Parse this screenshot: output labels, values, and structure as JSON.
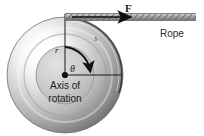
{
  "figure": {
    "background": "#ffffff",
    "width": 204,
    "height": 136
  },
  "labels": {
    "force": "F",
    "rope": "Rope",
    "axis_of_rotation_line1": "Axis of",
    "axis_of_rotation_line2": "rotation",
    "radius": "r",
    "angle": "θ",
    "arc_length": "s"
  },
  "colors": {
    "wheel_rim_dark": "#6f6f6f",
    "wheel_rim_mid": "#a8a8a8",
    "wheel_rim_light": "#f2f2f2",
    "hub_fill": "#c9c9c9",
    "hub_edge": "#9a9a9a",
    "line_stroke": "#1a1a1a",
    "arc_stroke": "#111111",
    "rope_stroke": "#8a8a8a",
    "text": "#1c1c1c"
  },
  "geometry": {
    "center_x": 65,
    "center_y": 75,
    "outer_radius": 58,
    "hub_radius": 28,
    "rope_y": 17,
    "rope_start_x": 65,
    "rope_end_x": 196,
    "arrow_tip_x": 133,
    "radius_line_end_x": 121,
    "vertical_line_top_y": 14
  },
  "elements": [
    {
      "name": "wheel",
      "type": "disc"
    },
    {
      "name": "hub",
      "type": "disc"
    },
    {
      "name": "axle-dot",
      "type": "point"
    },
    {
      "name": "radius-line-vertical",
      "type": "line"
    },
    {
      "name": "radius-line-horizontal",
      "type": "line"
    },
    {
      "name": "angle-arc",
      "type": "arc-arrow"
    },
    {
      "name": "arc-length-s",
      "type": "arc"
    },
    {
      "name": "rope",
      "type": "rope"
    },
    {
      "name": "force-arrow",
      "type": "arrow"
    }
  ]
}
